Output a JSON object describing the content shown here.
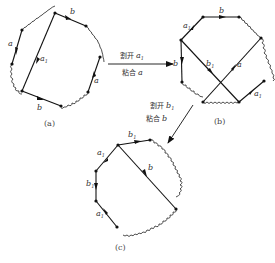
{
  "figures": [
    {
      "id": "a",
      "caption": "(a)",
      "labels": {
        "left_edge": "a",
        "top_edge": "b",
        "diagonal": "a",
        "diagonal_sub": "1",
        "right_edge": "a",
        "bottom_edge": "b"
      }
    },
    {
      "id": "b",
      "caption": "(b)",
      "labels": {
        "upper_left_edge": "a",
        "upper_left_edge_sub": "1",
        "top_edge": "b",
        "left_edge": "b",
        "diagonal_1": "b",
        "diagonal_1_sub": "1",
        "diagonal_2": "a",
        "lower_right_edge": "a",
        "lower_right_edge_sub": "1"
      }
    },
    {
      "id": "c",
      "caption": "(c)",
      "labels": {
        "top_edge": "b",
        "top_edge_sub": "1",
        "upper_left_edge": "a",
        "upper_left_edge_sub": "1",
        "left_edge": "b",
        "left_edge_sub": "1",
        "lower_left_edge": "a",
        "lower_left_edge_sub": "1",
        "diagonal": "b"
      }
    }
  ],
  "transitions": [
    {
      "from": "a",
      "to": "b",
      "cut_text": "割开",
      "cut_var": "a",
      "cut_sub": "1",
      "glue_text": "粘合",
      "glue_var": "a"
    },
    {
      "from": "b",
      "to": "c",
      "cut_text": "割开",
      "cut_var": "b",
      "cut_sub": "1",
      "glue_text": "粘合",
      "glue_var": "b"
    }
  ]
}
